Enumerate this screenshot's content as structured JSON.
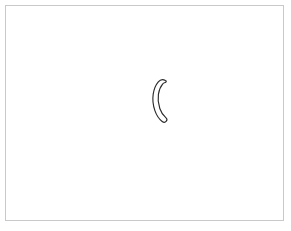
{
  "app": {
    "title": "Drawing Canvas",
    "background_color": "#ffffff"
  },
  "canvas": {
    "name": "drawing-canvas",
    "width": 291,
    "height": 231,
    "background_color": "#ffffff",
    "border_color": "#c9c9c9",
    "border_width": 1,
    "inset": 5
  },
  "drawing": {
    "description": "single hand-drawn outlined crescent stroke",
    "stroke_count": 1,
    "strokes": [
      {
        "name": "crescent-stroke",
        "shape": "crescent",
        "glyph_like": "(",
        "outline_color": "#2b2b2b",
        "fill_color": "#ffffff",
        "outline_width": 1.15,
        "bounds": {
          "x": 153,
          "y": 79,
          "width": 15,
          "height": 43
        },
        "outline_path": "M 165.4 80.6 C 163.0 79.0 160.2 79.6 158.3 81.9 C 155.6 85.1 153.9 89.4 153.2 94.2 C 152.4 99.6 153.0 105.3 154.9 110.6 C 156.5 115.2 159.0 119.0 162.2 121.5 C 163.6 122.6 165.3 122.4 166.3 121.2 C 167.2 120.1 167.0 118.6 165.8 117.6 C 163.2 115.5 161.1 112.3 159.8 108.5 C 158.2 103.9 157.7 99.0 158.4 94.4 C 159.0 90.3 160.4 86.7 162.6 84.1 C 163.2 83.4 163.9 82.9 164.5 82.8 C 165.7 82.6 166.5 81.8 166.3 81.3 C 166.2 81.0 165.9 80.8 165.4 80.6 Z"
      }
    ]
  }
}
